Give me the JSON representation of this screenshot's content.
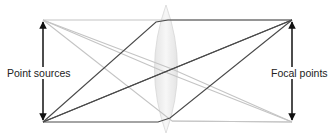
{
  "diagram": {
    "labels": {
      "left": "Point sources",
      "right": "Focal points"
    },
    "colors": {
      "light_ray": "#c4c4c4",
      "dark_ray": "#4a4a4a",
      "arrow": "#111111",
      "lens_fill": "#ececec",
      "lens_stroke": "#d6d6d6"
    },
    "points": {
      "source_top": [
        43,
        20
      ],
      "source_bottom": [
        43,
        122
      ],
      "focal_top": [
        292,
        20
      ],
      "focal_bottom": [
        292,
        122
      ]
    },
    "lens": {
      "center_x": 166,
      "top_y": 5,
      "bottom_y": 133,
      "half_width": 17
    }
  }
}
